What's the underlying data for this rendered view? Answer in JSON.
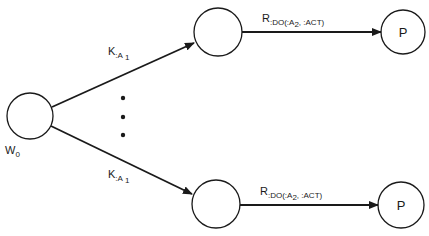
{
  "diagram": {
    "type": "state-transition-graph",
    "colors": {
      "stroke": "#1a1a1a",
      "background": "#ffffff"
    },
    "nodes": [
      {
        "id": "w0",
        "label": "",
        "outer_label_main": "W",
        "outer_label_sub": "0"
      },
      {
        "id": "top-mid",
        "label": ""
      },
      {
        "id": "top-p",
        "label": "P"
      },
      {
        "id": "bot-mid",
        "label": ""
      },
      {
        "id": "bot-p",
        "label": "P"
      }
    ],
    "edges": [
      {
        "from": "w0",
        "to": "top-mid",
        "label_main": "K",
        "label_sub": ":A",
        "label_subsub": "1"
      },
      {
        "from": "w0",
        "to": "bot-mid",
        "label_main": "K",
        "label_sub": ":A",
        "label_subsub": "1"
      },
      {
        "from": "top-mid",
        "to": "top-p",
        "label_main": "R",
        "label_sub_a": ":DO(:A",
        "label_sub_b": "2",
        "label_sub_c": ", :ACT)"
      },
      {
        "from": "bot-mid",
        "to": "bot-p",
        "label_main": "R",
        "label_sub_a": ":DO(:A",
        "label_sub_b": "2",
        "label_sub_c": ", :ACT)"
      }
    ],
    "ellipsis": "vertical-dots"
  }
}
